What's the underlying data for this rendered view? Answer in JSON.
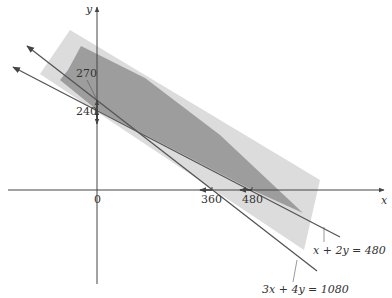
{
  "colors": {
    "axis": "#444444",
    "line": "#555555",
    "light_region": "#d9d9d9",
    "dark_region": "#9a9a9a",
    "text": "#333333"
  },
  "axes": {
    "x_label": "x",
    "y_label": "y",
    "origin_label": "0"
  },
  "ticks": {
    "y": [
      {
        "value": "270",
        "note": "y-intercept of 3x + 4y = 1080"
      },
      {
        "value": "240",
        "note": "y-intercept of x + 2y = 480"
      }
    ],
    "x": [
      {
        "value": "360",
        "note": "x-intercept of 3x + 4y = 1080"
      },
      {
        "value": "480",
        "note": "x-intercept of x + 2y = 480"
      }
    ]
  },
  "lines": [
    {
      "label": "3x + 4y = 1080",
      "x_intercept": 360,
      "y_intercept": 270
    },
    {
      "label": "x + 2y = 480",
      "x_intercept": 480,
      "y_intercept": 240
    }
  ],
  "regions": [
    {
      "name": "light-shaded-band"
    },
    {
      "name": "dark-shaded-band"
    }
  ]
}
